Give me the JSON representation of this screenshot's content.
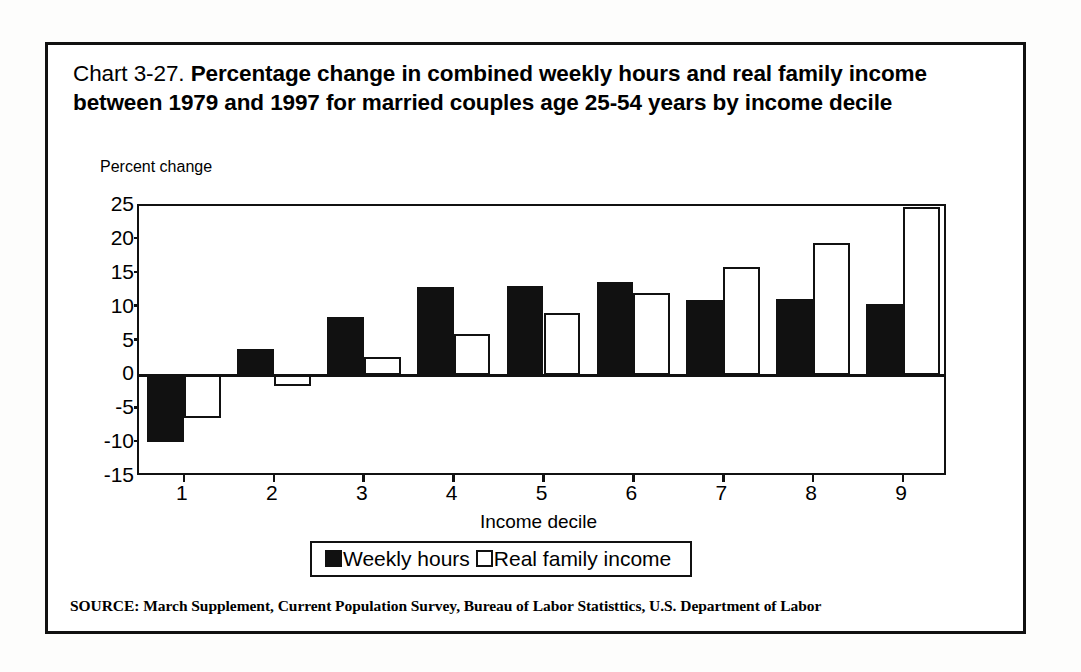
{
  "figure": {
    "title_prefix": "Chart 3-27.",
    "title_main": "Percentage change in combined weekly hours and real family income between 1979 and 1997 for married couples age 25-54 years by income decile",
    "source_note": "SOURCE: March Supplement, Current Population Survey, Bureau of Labor Statisttics, U.S. Department of Labor"
  },
  "chart_data": {
    "type": "bar",
    "title": "Chart 3-27. Percentage change in combined weekly hours and real family income between 1979 and 1997 for married couples age 25-54 years by income decile",
    "xlabel": "Income decile",
    "ylabel": "Percent change",
    "categories": [
      "1",
      "2",
      "3",
      "4",
      "5",
      "6",
      "7",
      "8",
      "9"
    ],
    "series": [
      {
        "name": "Weekly hours",
        "color": "#111111",
        "style": "filled",
        "values": [
          -9.8,
          3.9,
          8.6,
          13.1,
          13.2,
          13.8,
          11.1,
          11.3,
          10.6
        ]
      },
      {
        "name": "Real family income",
        "color": "#ffffff",
        "style": "hollow",
        "values": [
          -6.3,
          -1.5,
          2.7,
          6.1,
          9.2,
          12.2,
          16.0,
          19.5,
          24.8
        ]
      }
    ],
    "ylim": [
      -15,
      25
    ],
    "yticks": [
      25,
      20,
      15,
      10,
      5,
      0,
      -5,
      -10,
      -15
    ],
    "ytick_labels": [
      "25",
      "20",
      "15",
      "10",
      "5",
      "0",
      "-5",
      "-10",
      "-15"
    ],
    "grid": false,
    "legend_position": "bottom-center",
    "zero_line": 0
  }
}
